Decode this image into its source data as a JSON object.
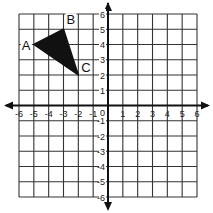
{
  "diagram": {
    "type": "coordinate-plane",
    "x_range": [
      -6,
      6
    ],
    "y_range": [
      -6,
      6
    ],
    "grid": true,
    "x_tick_labels": [
      "-6",
      "-5",
      "-4",
      "-3",
      "-2",
      "-1",
      "1",
      "2",
      "3",
      "4",
      "5",
      "6"
    ],
    "y_tick_labels": [
      "6",
      "5",
      "4",
      "3",
      "2",
      "1",
      "-1",
      "-2",
      "-3",
      "-4",
      "-5",
      "-6"
    ],
    "origin_label": "0",
    "colors": {
      "grid": "#333333",
      "axis": "#111111",
      "fill": "#111111"
    },
    "triangle": {
      "vertices": [
        {
          "label": "A",
          "x": -5,
          "y": 4
        },
        {
          "label": "B",
          "x": -3,
          "y": 5
        },
        {
          "label": "C",
          "x": -2,
          "y": 2
        }
      ],
      "filled": true
    }
  }
}
